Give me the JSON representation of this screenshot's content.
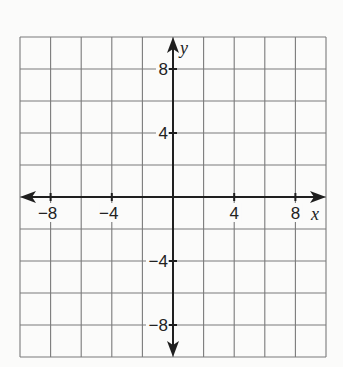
{
  "chart_data": {
    "type": "scatter",
    "title": "",
    "xlabel": "x",
    "ylabel": "y",
    "xlim": [
      -10,
      10
    ],
    "ylim": [
      -10,
      10
    ],
    "grid": true,
    "grid_step": 2,
    "x_ticks": [
      {
        "value": -8,
        "label": "−8"
      },
      {
        "value": -4,
        "label": "−4"
      },
      {
        "value": 4,
        "label": "4"
      },
      {
        "value": 8,
        "label": "8"
      }
    ],
    "y_ticks": [
      {
        "value": 8,
        "label": "8"
      },
      {
        "value": 4,
        "label": "4"
      },
      {
        "value": -4,
        "label": "−4"
      },
      {
        "value": -8,
        "label": "−8"
      }
    ],
    "points": [],
    "axis_arrows": "both-ends",
    "colors": {
      "grid": "#7a7a7a",
      "axis": "#1f1f1f",
      "text": "#222222"
    }
  }
}
